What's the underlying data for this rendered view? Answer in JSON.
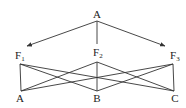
{
  "diagram": {
    "root": {
      "id": "root",
      "label": "A"
    },
    "middle": [
      {
        "id": "F1",
        "label": "F",
        "sub": "1"
      },
      {
        "id": "F2",
        "label": "F",
        "sub": "2"
      },
      {
        "id": "F3",
        "label": "F",
        "sub": "3"
      }
    ],
    "bottom": [
      {
        "id": "bA",
        "label": "A"
      },
      {
        "id": "bB",
        "label": "B"
      },
      {
        "id": "bC",
        "label": "C"
      }
    ],
    "root_edges": [
      {
        "from": "root",
        "to": "F1",
        "arrow": true
      },
      {
        "from": "root",
        "to": "F2",
        "arrow": false
      },
      {
        "from": "root",
        "to": "F3",
        "arrow": true
      }
    ],
    "cross_edges": [
      {
        "from": "F1",
        "to": "bA"
      },
      {
        "from": "F1",
        "to": "bB"
      },
      {
        "from": "F1",
        "to": "bC"
      },
      {
        "from": "F2",
        "to": "bA"
      },
      {
        "from": "F2",
        "to": "bB"
      },
      {
        "from": "F2",
        "to": "bC"
      },
      {
        "from": "F3",
        "to": "bA"
      },
      {
        "from": "F3",
        "to": "bB"
      },
      {
        "from": "F3",
        "to": "bC"
      }
    ],
    "colors": {
      "stroke": "#333333",
      "text": "#222222"
    }
  }
}
